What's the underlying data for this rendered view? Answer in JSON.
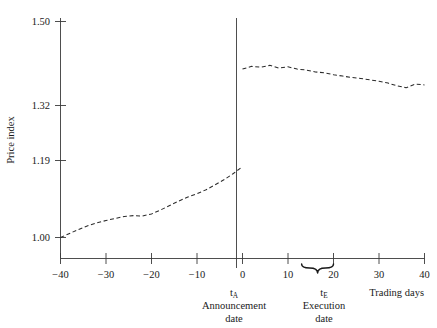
{
  "chart_data": {
    "type": "line",
    "title": "",
    "subtitle": "",
    "xlabel": "Trading days",
    "ylabel": "Price index",
    "grid": false,
    "legend": null,
    "xlim": [
      -40,
      40
    ],
    "ylim": [
      1.0,
      1.5
    ],
    "xticks": [
      -40,
      -30,
      -20,
      -10,
      0,
      10,
      20,
      30,
      40
    ],
    "xtick_labels": [
      "−40",
      "−30",
      "−20",
      "−10",
      "0",
      "10",
      "20",
      "30",
      "40"
    ],
    "yticks": [
      1.0,
      1.19,
      1.32,
      1.5
    ],
    "ytick_labels": [
      "1.00",
      "1.19",
      "1.32",
      "1.50"
    ],
    "line_style": "dashed",
    "series": [
      {
        "name": "Pre-announcement price index",
        "x": [
          -40,
          -38,
          -36,
          -34,
          -32,
          -30,
          -28,
          -26,
          -24,
          -22,
          -20,
          -18,
          -16,
          -14,
          -12,
          -10,
          -8,
          -6,
          -4,
          -2,
          0
        ],
        "values": [
          1.0,
          1.01,
          1.02,
          1.029,
          1.036,
          1.042,
          1.047,
          1.052,
          1.054,
          1.053,
          1.058,
          1.068,
          1.079,
          1.09,
          1.1,
          1.108,
          1.118,
          1.13,
          1.143,
          1.158,
          1.175
        ]
      },
      {
        "name": "Post-announcement price index",
        "x": [
          0,
          2,
          4,
          6,
          8,
          10,
          12,
          14,
          16,
          18,
          20,
          22,
          24,
          26,
          28,
          30,
          32,
          34,
          36,
          38,
          40
        ],
        "values": [
          1.398,
          1.404,
          1.402,
          1.406,
          1.4,
          1.403,
          1.398,
          1.396,
          1.392,
          1.39,
          1.386,
          1.383,
          1.38,
          1.378,
          1.375,
          1.372,
          1.368,
          1.362,
          1.358,
          1.366,
          1.364
        ]
      }
    ],
    "annotations": [
      {
        "id": "announcement",
        "x": 0,
        "symbol": "t",
        "subscript": "A",
        "line1": "Announcement",
        "line2": "date",
        "has_vertical_rule": true
      },
      {
        "id": "execution",
        "x": 20,
        "symbol": "t",
        "subscript": "E",
        "line1": "Execution",
        "line2": "date",
        "has_vertical_rule": false,
        "brace_span": [
          13,
          20
        ]
      }
    ]
  }
}
